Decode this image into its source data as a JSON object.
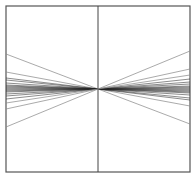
{
  "diagram": {
    "frame": {
      "x1": 6,
      "y1": 6,
      "x2": 190,
      "y2": 172,
      "stroke": "#555555"
    },
    "vertical_axis": {
      "x": 98,
      "y1": 6,
      "y2": 172,
      "stroke": "#444444"
    },
    "center": {
      "x": 98,
      "y": 89
    },
    "line_offsets": [
      -35,
      -17,
      -11,
      -9,
      -6,
      -4,
      -3,
      -2,
      -1,
      0,
      1,
      2,
      3,
      5,
      7,
      10,
      14,
      20,
      38
    ],
    "line_colors": {
      "outer": "#888888",
      "inner": "#222222"
    }
  }
}
